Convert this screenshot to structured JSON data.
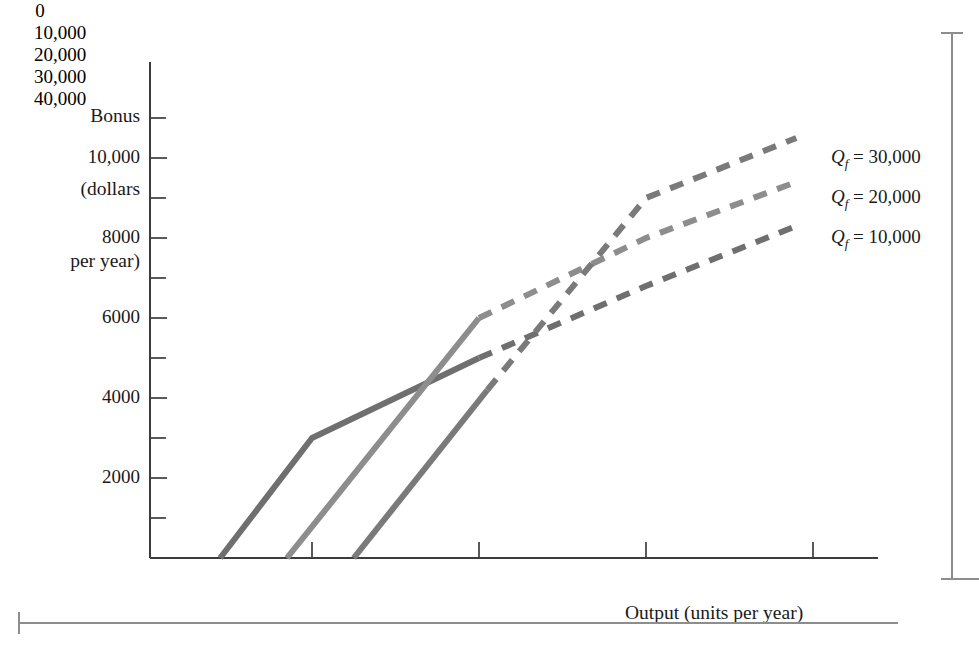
{
  "figure": {
    "background_color": "#ffffff",
    "axis_color": "#3c3c3c"
  },
  "chart_data": {
    "type": "line",
    "title": "",
    "xlabel": "Output (units per year)",
    "ylabel": "Bonus (dollars per year)",
    "ylabel_lines": [
      "Bonus",
      "(dollars",
      "per year)"
    ],
    "xlim": [
      0,
      45000
    ],
    "ylim": [
      0,
      11500
    ],
    "grid": false,
    "legend_position": "right-of-plot-inline",
    "x_ticks": [
      0,
      10000,
      20000,
      30000,
      40000
    ],
    "x_tick_labels": [
      "0",
      "10,000",
      "20,000",
      "30,000",
      "40,000"
    ],
    "y_ticks": [
      2000,
      4000,
      6000,
      8000,
      10000
    ],
    "y_tick_labels": [
      "2000",
      "4000",
      "6000",
      "8000",
      "10,000"
    ],
    "y_minor_ticks": [
      1000,
      3000,
      5000,
      7000,
      9000,
      11000
    ],
    "series": [
      {
        "name": "Qf = 10,000",
        "label_text": "Q_f = 10,000",
        "label_base": "Q",
        "label_sub": "f",
        "label_rest": " = 10,000",
        "color": "#6f6f6f",
        "solid_points": [
          [
            4500,
            0
          ],
          [
            10000,
            3000
          ],
          [
            20000,
            5000
          ]
        ],
        "dashed_points": [
          [
            20000,
            5000
          ],
          [
            30000,
            6800
          ],
          [
            39000,
            8300
          ]
        ]
      },
      {
        "name": "Qf = 20,000",
        "label_text": "Q_f = 20,000",
        "label_base": "Q",
        "label_sub": "f",
        "label_rest": " = 20,000",
        "color": "#8d8d8d",
        "solid_points": [
          [
            8500,
            0
          ],
          [
            20000,
            6000
          ]
        ],
        "dashed_points": [
          [
            20000,
            6000
          ],
          [
            30000,
            8000
          ],
          [
            39000,
            9400
          ]
        ]
      },
      {
        "name": "Qf = 30,000",
        "label_text": "Q_f = 30,000",
        "label_base": "Q",
        "label_sub": "f",
        "label_rest": " = 30,000",
        "color": "#7a7a7a",
        "solid_points": [
          [
            12500,
            0
          ],
          [
            20500,
            4200
          ]
        ],
        "dashed_points": [
          [
            20500,
            4200
          ],
          [
            30000,
            9000
          ],
          [
            39000,
            10500
          ]
        ]
      }
    ]
  },
  "series_labels": {
    "top": {
      "base": "Q",
      "sub": "f",
      "rest": " = 30,000"
    },
    "middle": {
      "base": "Q",
      "sub": "f",
      "rest": " = 20,000"
    },
    "bottom": {
      "base": "Q",
      "sub": "f",
      "rest": " = 10,000"
    }
  }
}
